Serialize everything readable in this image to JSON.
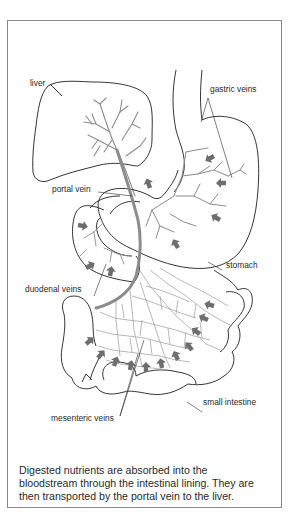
{
  "figure": {
    "type": "anatomical-diagram",
    "labels": {
      "liver": "liver",
      "gastric_veins": "gastric veins",
      "portal_vein": "portal vein",
      "stomach": "stomach",
      "duodenal_veins": "duodenal veins",
      "small_intestine": "small intestine",
      "mesenteric_veins": "mesenteric veins"
    },
    "caption": {
      "line1": "Digested nutrients are absorbed into the",
      "line2": "bloodstream through the intestinal lining. They are",
      "line3": "then transported by the portal vein to the liver."
    },
    "colors": {
      "outline": "#1e1e1e",
      "vein": "#8c8c8c",
      "arrow": "#6e6e6e",
      "frame": "#8a8a8a",
      "text": "#2a2a2a"
    },
    "icons": {
      "arrow": "flow-arrow-icon"
    }
  }
}
